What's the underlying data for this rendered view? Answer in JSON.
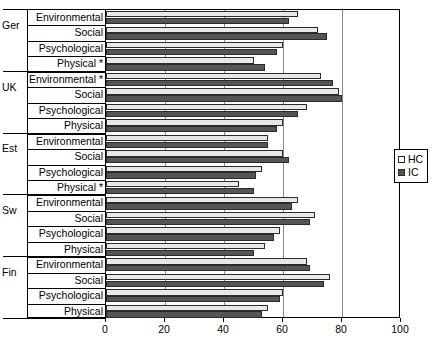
{
  "chart_data": {
    "type": "bar",
    "orientation": "horizontal",
    "title": "",
    "xlabel": "",
    "ylabel": "",
    "xlim": [
      0,
      100
    ],
    "xticks": [
      0,
      20,
      40,
      60,
      80,
      100
    ],
    "xtick_labels": [
      "0",
      "20",
      "40",
      "60",
      "80",
      "100"
    ],
    "grid": true,
    "grid_axis": "x",
    "legend": {
      "position": "right",
      "entries": [
        {
          "name": "HC",
          "color": "#e8e8e8"
        },
        {
          "name": "IC",
          "color": "#555555"
        }
      ]
    },
    "series": [
      {
        "name": "HC",
        "color": "#e8e8e8"
      },
      {
        "name": "IC",
        "color": "#555555"
      }
    ],
    "groups": [
      {
        "group": "Ger",
        "categories": [
          {
            "label": "Environmental",
            "significant": false,
            "HC": 65,
            "IC": 62
          },
          {
            "label": "Social",
            "significant": false,
            "HC": 72,
            "IC": 75
          },
          {
            "label": "Psychological",
            "significant": false,
            "HC": 60,
            "IC": 58
          },
          {
            "label": "Physical *",
            "significant": true,
            "HC": 50,
            "IC": 54
          }
        ]
      },
      {
        "group": "UK",
        "categories": [
          {
            "label": "Environmental *",
            "significant": true,
            "HC": 73,
            "IC": 77
          },
          {
            "label": "Social",
            "significant": false,
            "HC": 79,
            "IC": 80
          },
          {
            "label": "Psychological",
            "significant": false,
            "HC": 68,
            "IC": 65
          },
          {
            "label": "Physical",
            "significant": false,
            "HC": 60,
            "IC": 58
          }
        ]
      },
      {
        "group": "Est",
        "categories": [
          {
            "label": "Environmental",
            "significant": false,
            "HC": 55,
            "IC": 55
          },
          {
            "label": "Social",
            "significant": false,
            "HC": 60,
            "IC": 62
          },
          {
            "label": "Psychological",
            "significant": false,
            "HC": 53,
            "IC": 51
          },
          {
            "label": "Physical *",
            "significant": true,
            "HC": 45,
            "IC": 50
          }
        ]
      },
      {
        "group": "Sw",
        "categories": [
          {
            "label": "Environmental",
            "significant": false,
            "HC": 65,
            "IC": 63
          },
          {
            "label": "Social",
            "significant": false,
            "HC": 71,
            "IC": 69
          },
          {
            "label": "Psychological",
            "significant": false,
            "HC": 59,
            "IC": 57
          },
          {
            "label": "Physical",
            "significant": false,
            "HC": 54,
            "IC": 50
          }
        ]
      },
      {
        "group": "Fin",
        "categories": [
          {
            "label": "Environmental",
            "significant": false,
            "HC": 68,
            "IC": 69
          },
          {
            "label": "Social",
            "significant": false,
            "HC": 76,
            "IC": 74
          },
          {
            "label": "Psychological",
            "significant": false,
            "HC": 60,
            "IC": 59
          },
          {
            "label": "Physical",
            "significant": false,
            "HC": 55,
            "IC": 53
          }
        ]
      }
    ]
  }
}
